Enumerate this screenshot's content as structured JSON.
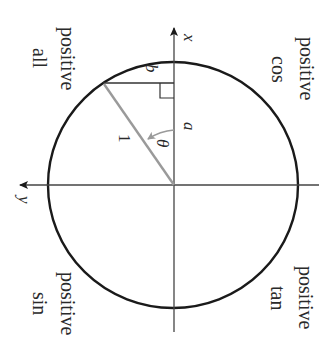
{
  "diagram": {
    "axes": {
      "x_label": "x",
      "y_label": "y"
    },
    "quadrants": [
      {
        "id": "q1",
        "line1": "all",
        "line2": "positive"
      },
      {
        "id": "q2",
        "line1": "cos",
        "line2": "positive"
      },
      {
        "id": "q3",
        "line1": "sin",
        "line2": "positive"
      },
      {
        "id": "q4",
        "line1": "tan",
        "line2": "positive"
      }
    ],
    "triangle": {
      "hypotenuse_label": "1",
      "opposite_label": "b",
      "adjacent_label": "a",
      "angle_label": "θ"
    },
    "colors": {
      "ink": "#1a1a1a",
      "radius_line": "#9a9a9a",
      "angle_arrow": "#9a9a9a"
    }
  }
}
